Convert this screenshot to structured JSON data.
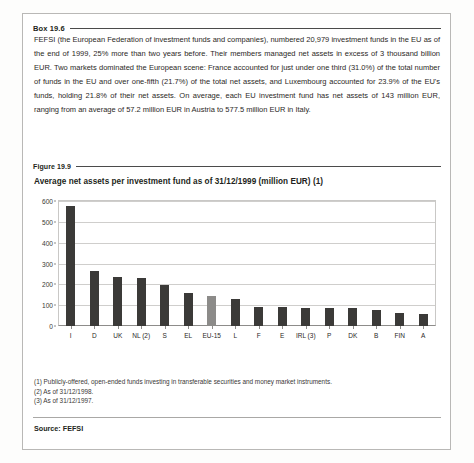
{
  "box": {
    "label": "Box 19.6",
    "paragraph": "FEFSI (the European Federation of investment funds and companies), numbered 20,979 investment funds in the EU as of the end of 1999, 25% more than two years before. Their members managed net assets in excess of 3 thousand billion EUR. Two markets dominated the European scene: France accounted for just under one third (31.0%) of the total number of funds in the EU and over one-fifth (21.7%) of the total net assets, and Luxembourg accounted for 23.9% of the EU's funds, holding 21.8% of their net assets. On average, each EU investment fund has net assets of 143 million EUR, ranging from an average of 57.2 million EUR in Austria to 577.5 million EUR in Italy."
  },
  "figure": {
    "label": "Figure 19.9",
    "title": "Average net assets per investment fund as of 31/12/1999 (million EUR) (1)"
  },
  "notes": [
    "(1) Publicly-offered, open-ended funds investing in transferable securities and money market instruments.",
    "(2) As of 31/12/1998.",
    "(3) As of 31/12/1997."
  ],
  "source": "Source: FEFSI",
  "colors": {
    "bar": "#3b3a38",
    "bar_highlight": "#8c8b89",
    "grid": "#cfcecc",
    "axis": "#8d8c8a"
  },
  "chart_data": {
    "type": "bar",
    "title": "Average net assets per investment fund as of 31/12/1999 (million EUR) (1)",
    "xlabel": "",
    "ylabel": "",
    "ylim": [
      0,
      600
    ],
    "yticks": [
      0,
      100,
      200,
      300,
      400,
      500,
      600
    ],
    "ytick_labels": [
      "0",
      "100",
      "200",
      "300",
      "400",
      "500",
      "600"
    ],
    "grid": true,
    "legend": "none",
    "highlight_category": "EU-15",
    "categories": [
      "I",
      "D",
      "UK",
      "NL (2)",
      "S",
      "EL",
      "EU-15",
      "L",
      "F",
      "E",
      "IRL (3)",
      "P",
      "DK",
      "B",
      "FIN",
      "A"
    ],
    "values": [
      577.5,
      265,
      235,
      230,
      195,
      160,
      143,
      130,
      90,
      90,
      88,
      88,
      85,
      78,
      62,
      57.2
    ]
  }
}
